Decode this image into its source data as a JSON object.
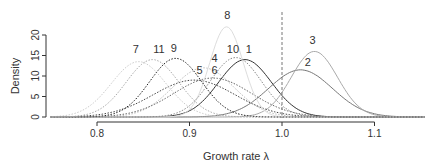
{
  "chart_data": {
    "type": "line",
    "title": "",
    "xlabel": "Growth rate  λ",
    "ylabel": "Density",
    "xlim": [
      0.75,
      1.15
    ],
    "ylim": [
      0,
      20
    ],
    "x_ticks": [
      "0.8",
      "0.9",
      "1.0",
      "1.1"
    ],
    "y_ticks": [
      "0",
      "5",
      "10",
      "15",
      "20"
    ],
    "reference_line": {
      "x": 1.0,
      "style": "dashed"
    },
    "grid": false,
    "legend": "none (curves labeled inline)",
    "series": [
      {
        "name": "1",
        "mean": 0.96,
        "peak": 14.0,
        "sd": 0.0285,
        "color": "#333333",
        "dash": "solid"
      },
      {
        "name": "2",
        "mean": 1.02,
        "peak": 11.5,
        "sd": 0.0345,
        "color": "#777777",
        "dash": "solid"
      },
      {
        "name": "3",
        "mean": 1.035,
        "peak": 16.0,
        "sd": 0.025,
        "color": "#aaaaaa",
        "dash": "solid"
      },
      {
        "name": "4",
        "mean": 0.915,
        "peak": 12.0,
        "sd": 0.033,
        "color": "#bbbbbb",
        "dash": "dot"
      },
      {
        "name": "5",
        "mean": 0.905,
        "peak": 9.0,
        "sd": 0.044,
        "color": "#444444",
        "dash": "dot"
      },
      {
        "name": "6",
        "mean": 0.925,
        "peak": 9.5,
        "sd": 0.042,
        "color": "#666666",
        "dash": "dot"
      },
      {
        "name": "7",
        "mean": 0.845,
        "peak": 13.5,
        "sd": 0.0295,
        "color": "#cccccc",
        "dash": "dot"
      },
      {
        "name": "8",
        "mean": 0.94,
        "peak": 22.0,
        "sd": 0.018,
        "color": "#dddddd",
        "dash": "solid"
      },
      {
        "name": "9",
        "mean": 0.885,
        "peak": 14.3,
        "sd": 0.028,
        "color": "#222222",
        "dash": "dot"
      },
      {
        "name": "10",
        "mean": 0.95,
        "peak": 14.5,
        "sd": 0.0275,
        "color": "#888888",
        "dash": "dot"
      },
      {
        "name": "11",
        "mean": 0.86,
        "peak": 14.0,
        "sd": 0.0285,
        "color": "#aaaaaa",
        "dash": "dot"
      }
    ],
    "labels": [
      {
        "text": "7",
        "x": 0.842,
        "y": 15.5
      },
      {
        "text": "11",
        "x": 0.867,
        "y": 15.5
      },
      {
        "text": "9",
        "x": 0.883,
        "y": 15.8
      },
      {
        "text": "5",
        "x": 0.911,
        "y": 10.4
      },
      {
        "text": "4",
        "x": 0.927,
        "y": 13.3
      },
      {
        "text": "6",
        "x": 0.927,
        "y": 10.4
      },
      {
        "text": "8",
        "x": 0.941,
        "y": 24.0
      },
      {
        "text": "10",
        "x": 0.947,
        "y": 15.5
      },
      {
        "text": "1",
        "x": 0.964,
        "y": 15.5
      },
      {
        "text": "3",
        "x": 1.033,
        "y": 17.8
      },
      {
        "text": "2",
        "x": 1.028,
        "y": 12.5
      }
    ]
  }
}
